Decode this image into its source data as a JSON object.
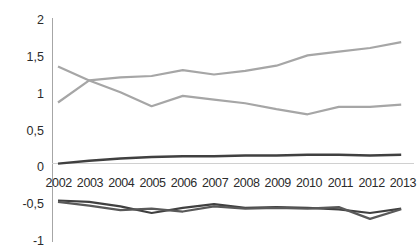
{
  "chart_data": {
    "type": "line",
    "title": "",
    "xlabel": "",
    "ylabel": "",
    "ylim": [
      -1,
      2
    ],
    "yticks": [
      2,
      1.5,
      1,
      0.5,
      0,
      -0.5,
      -1
    ],
    "ytick_labels": [
      "2",
      "1,5",
      "1",
      "0,5",
      "0",
      "-0,5",
      "-1"
    ],
    "decimal_separator": ",",
    "grid": false,
    "legend": "none",
    "zero_baseline": true,
    "categories": [
      "2002",
      "2003",
      "2004",
      "2005",
      "2006",
      "2007",
      "2008",
      "2009",
      "2010",
      "2011",
      "2012",
      "2013"
    ],
    "x": [
      2002,
      2003,
      2004,
      2005,
      2006,
      2007,
      2008,
      2009,
      2010,
      2011,
      2012,
      2013
    ],
    "series": [
      {
        "name": "series-1",
        "color": "#a6a6a6",
        "width": 2.2,
        "values": [
          0.88,
          1.18,
          1.22,
          1.24,
          1.32,
          1.26,
          1.31,
          1.38,
          1.52,
          1.57,
          1.62,
          1.7
        ]
      },
      {
        "name": "series-2",
        "color": "#a6a6a6",
        "width": 2.2,
        "values": [
          1.37,
          1.18,
          1.02,
          0.83,
          0.97,
          0.92,
          0.87,
          0.79,
          0.72,
          0.82,
          0.82,
          0.85
        ]
      },
      {
        "name": "series-3",
        "color": "#404040",
        "width": 2.4,
        "values": [
          0.05,
          0.09,
          0.12,
          0.14,
          0.15,
          0.15,
          0.16,
          0.16,
          0.17,
          0.17,
          0.16,
          0.17
        ]
      },
      {
        "name": "series-4",
        "color": "#404040",
        "width": 2.2,
        "values": [
          -0.45,
          -0.47,
          -0.53,
          -0.62,
          -0.55,
          -0.5,
          -0.55,
          -0.54,
          -0.55,
          -0.57,
          -0.62,
          -0.56
        ]
      },
      {
        "name": "series-5",
        "color": "#595959",
        "width": 2.2,
        "values": [
          -0.47,
          -0.52,
          -0.58,
          -0.56,
          -0.6,
          -0.53,
          -0.56,
          -0.55,
          -0.56,
          -0.54,
          -0.7,
          -0.57
        ]
      }
    ]
  },
  "axis": {
    "y_tick_labels": [
      "2",
      "1,5",
      "1",
      "0,5",
      "0",
      "-0,5",
      "-1"
    ],
    "x_tick_labels": [
      "2002",
      "2003",
      "2004",
      "2005",
      "2006",
      "2007",
      "2008",
      "2009",
      "2010",
      "2011",
      "2012",
      "2013"
    ]
  },
  "colors": {
    "axis": "#a6a6a6",
    "zero_line": "#d0d0d0",
    "light_series": "#a6a6a6",
    "dark_series": "#404040",
    "text": "#2b2b2b",
    "background": "#ffffff"
  },
  "title_strip": {
    "text": ""
  }
}
